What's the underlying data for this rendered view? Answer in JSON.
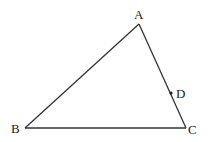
{
  "diagram": {
    "type": "triangle",
    "stroke_color": "#333333",
    "points": {
      "A": {
        "label": "A",
        "x": 139,
        "y": 24
      },
      "B": {
        "label": "B",
        "x": 25,
        "y": 128
      },
      "C": {
        "label": "C",
        "x": 186,
        "y": 128
      },
      "D": {
        "label": "D",
        "x": 171,
        "y": 93,
        "on_segment": "AC"
      }
    },
    "segments": [
      "AB",
      "BC",
      "CA"
    ]
  }
}
